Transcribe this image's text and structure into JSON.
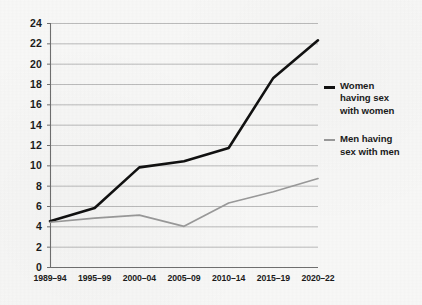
{
  "chart_data": {
    "type": "line",
    "title": "",
    "subtitle": "",
    "xlabel": "",
    "ylabel": "",
    "x": [
      "1989–94",
      "1995–99",
      "2000–04",
      "2005–09",
      "2010–14",
      "2015–19",
      "2020–22"
    ],
    "xtick_labels": [
      "1989–94",
      "1995–99",
      "2000–04",
      "2005–09",
      "2010–14",
      "2015–19",
      "2020–22"
    ],
    "ytick_labels": [
      "0",
      "2",
      "4",
      "6",
      "8",
      "10",
      "12",
      "14",
      "16",
      "18",
      "20",
      "22",
      "24"
    ],
    "yticks": [
      0,
      2,
      4,
      6,
      8,
      10,
      12,
      14,
      16,
      18,
      20,
      22,
      24
    ],
    "ylim": [
      0,
      24
    ],
    "grid": "horizontal",
    "legend_position": "right",
    "series": [
      {
        "name": "Women having sex with women",
        "legend_label_lines": [
          "Women",
          "having sex",
          "with women"
        ],
        "color": "#111111",
        "values": [
          4.5,
          5.8,
          9.8,
          10.4,
          11.7,
          18.6,
          22.3
        ]
      },
      {
        "name": "Men having sex with men",
        "legend_label_lines": [
          "Men having",
          "sex with men"
        ],
        "color": "#9a9a9a",
        "values": [
          4.4,
          4.8,
          5.1,
          4.0,
          6.3,
          7.4,
          8.7
        ]
      }
    ]
  },
  "legend": {
    "entries": [
      {
        "label_line1": "Women",
        "label_line2": "having sex",
        "label_line3": "with women"
      },
      {
        "label_line1": "Men having",
        "label_line2": "sex with men",
        "label_line3": ""
      }
    ]
  },
  "colors": {
    "series_women": "#111111",
    "series_men": "#9a9a9a",
    "axis": "#6f6f6f",
    "gridline": "#b4b4b4",
    "text": "#1b1b1b",
    "background": "#f8f8f7"
  }
}
